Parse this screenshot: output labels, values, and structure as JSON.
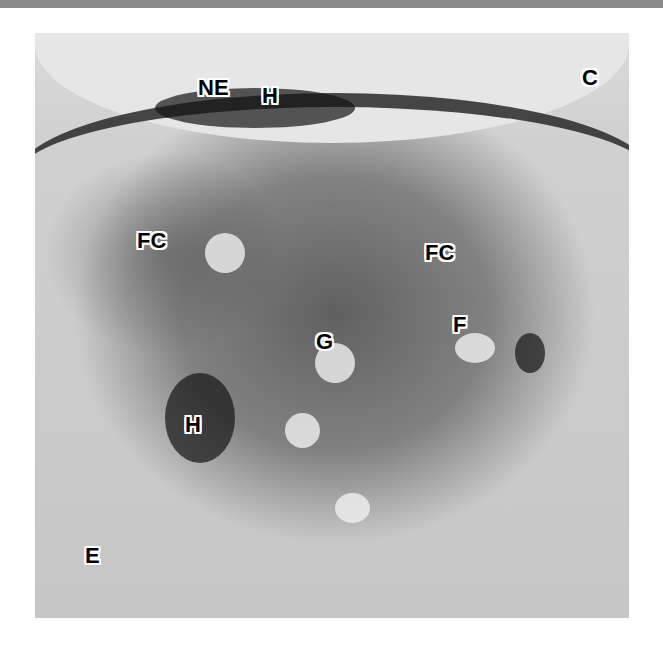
{
  "figure": {
    "type": "electron micrograph",
    "labels": {
      "ne": "NE",
      "h_top": "H",
      "c": "C",
      "fc_left": "FC",
      "fc_right": "FC",
      "f": "F",
      "g": "G",
      "h_bottom": "H",
      "e": "E"
    }
  }
}
